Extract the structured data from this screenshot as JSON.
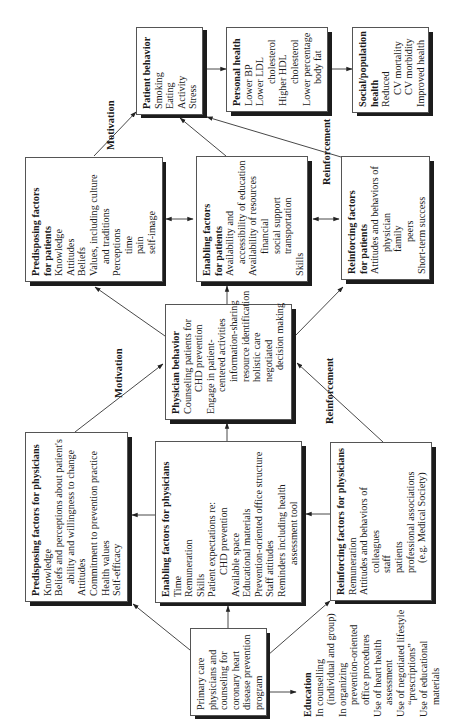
{
  "diagram": {
    "orientation": "rotated-90-ccw",
    "colors": {
      "box_border": "#555555",
      "shadow": "#1c1c1c",
      "line": "#333333",
      "text": "#1a1a1a"
    },
    "labels": {
      "motivation_top": "Motivation",
      "motivation_bottom": "Motivation",
      "reinforcement_top": "Reinforcement",
      "reinforcement_bottom": "Reinforcement"
    },
    "boxes": {
      "patient_behavior": {
        "title": "Patient behavior",
        "lines": [
          "Smoking",
          "Eating",
          "Activity",
          "Stress"
        ]
      },
      "personal_health": {
        "title": "Personal health",
        "lines": [
          "Lower BP",
          "Lower LDL",
          "cholesterol",
          "Higher HDL",
          "cholesterol",
          "Lower percentage",
          "body fat"
        ]
      },
      "social_health": {
        "title": "Social/population",
        "title2": "health",
        "lines": [
          "Reduced",
          "CV mortality",
          "CV morbidity",
          "Improved health"
        ]
      },
      "predisposing_patients": {
        "title": "Predisposing factors",
        "title2": "for patients",
        "lines": [
          "Knowledge",
          "Attitudes",
          "Beliefs",
          "Values, including culture",
          "and traditions",
          "Perceptions",
          "time",
          "pain",
          "self-image"
        ]
      },
      "enabling_patients": {
        "title": "Enabling factors",
        "title2": "for patients",
        "lines": [
          "Availability and",
          "accessibility of education",
          "Availability of resources",
          "financial",
          "social support",
          "transportation",
          "Skills"
        ]
      },
      "reinforcing_patients": {
        "title": "Reinforcing factors",
        "title2": "for patients",
        "lines": [
          "Attitudes and behaviors of",
          "physician",
          "family",
          "peers",
          "Short-term success"
        ]
      },
      "physician_behavior": {
        "title": "Physician behavior",
        "lines": [
          "Counseling patients for",
          "CHD prevention",
          "Engage in patient-",
          "centered activities",
          "information-sharing",
          "resource identification",
          "holistic care",
          "negotiated",
          "decision making"
        ]
      },
      "predisposing_physicians": {
        "title": "Predisposing factors for physicians",
        "lines": [
          "Knowledge",
          "Beliefs and perceptions about patient's",
          "ability and willingness to change",
          "Attitudes",
          "Commitment to prevention practice",
          "Health values",
          "Self-efficacy"
        ]
      },
      "enabling_physicians": {
        "title": "Enabling factors for physicians",
        "lines": [
          "Time",
          "Remuneration",
          "Skills",
          "Patient expectations re:",
          "CHD prevention",
          "Available space",
          "Educational materials",
          "Prevention-oriented office structure",
          "Staff attitudes",
          "Reminders including health",
          "assessment tool"
        ]
      },
      "reinforcing_physicians": {
        "title": "Reinforcing factors for physicians",
        "lines": [
          "Remuneration",
          "Attitudes and behaviors of",
          "colleagues",
          "staff",
          "patients",
          "professional associations",
          "(e.g. Medical Society)"
        ]
      },
      "primary_care": {
        "lines": [
          "Primary care",
          "physicians and",
          "counseling for",
          "coronary heart",
          "disease prevention",
          "program"
        ]
      },
      "education": {
        "title": "Education",
        "lines": [
          "In counselling",
          "(individual and group)",
          "In organizing",
          "prevention-oriented",
          "office procedures",
          "Use of heart health",
          "assessment",
          "Use of negotiated lifestyle",
          "“prescriptions”",
          "Use of educational",
          "materials"
        ]
      }
    }
  }
}
